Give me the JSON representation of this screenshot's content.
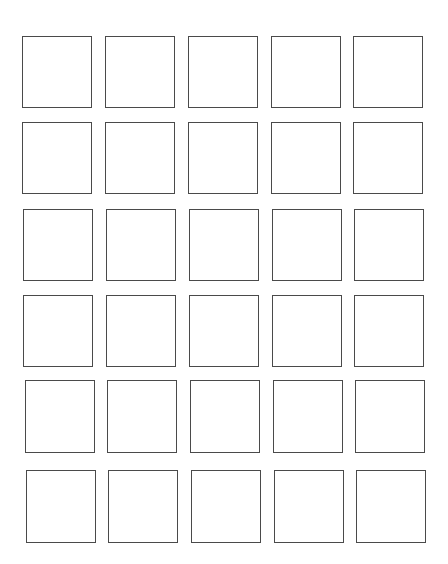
{
  "page": {
    "background": "#ffffff",
    "border_color": "#4a4a4a"
  },
  "grid": {
    "rows": 6,
    "cols": 5,
    "cells": [
      {
        "row": 0,
        "col": 0,
        "x": 22,
        "y": 36,
        "w": 70,
        "h": 72
      },
      {
        "row": 0,
        "col": 1,
        "x": 105,
        "y": 36,
        "w": 70,
        "h": 72
      },
      {
        "row": 0,
        "col": 2,
        "x": 188,
        "y": 36,
        "w": 70,
        "h": 72
      },
      {
        "row": 0,
        "col": 3,
        "x": 271,
        "y": 36,
        "w": 70,
        "h": 72
      },
      {
        "row": 0,
        "col": 4,
        "x": 353,
        "y": 36,
        "w": 70,
        "h": 72
      },
      {
        "row": 1,
        "col": 0,
        "x": 22,
        "y": 122,
        "w": 70,
        "h": 72
      },
      {
        "row": 1,
        "col": 1,
        "x": 105,
        "y": 122,
        "w": 70,
        "h": 72
      },
      {
        "row": 1,
        "col": 2,
        "x": 188,
        "y": 122,
        "w": 70,
        "h": 72
      },
      {
        "row": 1,
        "col": 3,
        "x": 271,
        "y": 122,
        "w": 70,
        "h": 72
      },
      {
        "row": 1,
        "col": 4,
        "x": 353,
        "y": 122,
        "w": 70,
        "h": 72
      },
      {
        "row": 2,
        "col": 0,
        "x": 23,
        "y": 209,
        "w": 70,
        "h": 72
      },
      {
        "row": 2,
        "col": 1,
        "x": 106,
        "y": 209,
        "w": 70,
        "h": 72
      },
      {
        "row": 2,
        "col": 2,
        "x": 189,
        "y": 209,
        "w": 70,
        "h": 72
      },
      {
        "row": 2,
        "col": 3,
        "x": 272,
        "y": 209,
        "w": 70,
        "h": 72
      },
      {
        "row": 2,
        "col": 4,
        "x": 354,
        "y": 209,
        "w": 70,
        "h": 72
      },
      {
        "row": 3,
        "col": 0,
        "x": 23,
        "y": 295,
        "w": 70,
        "h": 72
      },
      {
        "row": 3,
        "col": 1,
        "x": 106,
        "y": 295,
        "w": 70,
        "h": 72
      },
      {
        "row": 3,
        "col": 2,
        "x": 189,
        "y": 295,
        "w": 70,
        "h": 72
      },
      {
        "row": 3,
        "col": 3,
        "x": 272,
        "y": 295,
        "w": 70,
        "h": 72
      },
      {
        "row": 3,
        "col": 4,
        "x": 354,
        "y": 295,
        "w": 70,
        "h": 72
      },
      {
        "row": 4,
        "col": 0,
        "x": 25,
        "y": 380,
        "w": 70,
        "h": 73
      },
      {
        "row": 4,
        "col": 1,
        "x": 107,
        "y": 380,
        "w": 70,
        "h": 73
      },
      {
        "row": 4,
        "col": 2,
        "x": 190,
        "y": 380,
        "w": 70,
        "h": 73
      },
      {
        "row": 4,
        "col": 3,
        "x": 273,
        "y": 380,
        "w": 70,
        "h": 73
      },
      {
        "row": 4,
        "col": 4,
        "x": 355,
        "y": 380,
        "w": 70,
        "h": 73
      },
      {
        "row": 5,
        "col": 0,
        "x": 26,
        "y": 470,
        "w": 70,
        "h": 73
      },
      {
        "row": 5,
        "col": 1,
        "x": 108,
        "y": 470,
        "w": 70,
        "h": 73
      },
      {
        "row": 5,
        "col": 2,
        "x": 191,
        "y": 470,
        "w": 70,
        "h": 73
      },
      {
        "row": 5,
        "col": 3,
        "x": 274,
        "y": 470,
        "w": 70,
        "h": 73
      },
      {
        "row": 5,
        "col": 4,
        "x": 356,
        "y": 470,
        "w": 70,
        "h": 73
      }
    ]
  }
}
